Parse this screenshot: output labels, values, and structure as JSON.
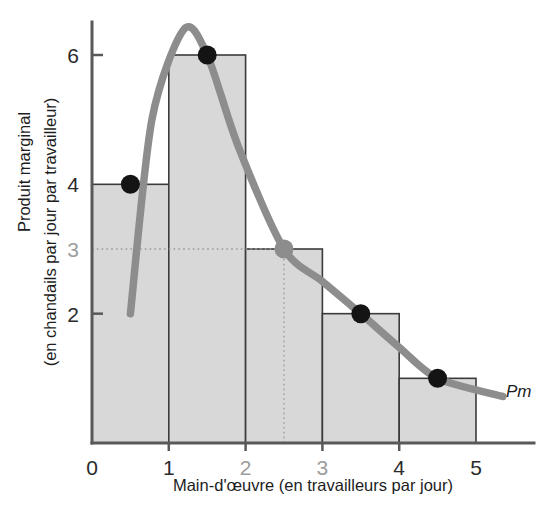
{
  "chart_data": {
    "type": "bar",
    "title": "",
    "subtitle": "",
    "xlabel": "Main-d'œuvre (en travailleurs par jour)",
    "ylabel_line1": "Produit marginal",
    "ylabel_line2": "(en chandails par jour par travailleur)",
    "xlim": [
      0,
      5.55
    ],
    "ylim": [
      0,
      6.55
    ],
    "grid": true,
    "legend_position": "inline-right",
    "categories": [
      "0-1",
      "1-2",
      "2-3",
      "3-4",
      "4-5"
    ],
    "values": [
      4,
      6,
      3,
      2,
      1
    ],
    "bar_intervals": [
      [
        0,
        1
      ],
      [
        1,
        2
      ],
      [
        2,
        3
      ],
      [
        3,
        4
      ],
      [
        4,
        5
      ]
    ],
    "x_ticks": [
      {
        "value": 0,
        "label": "0",
        "muted": false
      },
      {
        "value": 1,
        "label": "1",
        "muted": false
      },
      {
        "value": 2,
        "label": "2",
        "muted": true
      },
      {
        "value": 3,
        "label": "3",
        "muted": true
      },
      {
        "value": 4,
        "label": "4",
        "muted": false
      },
      {
        "value": 5,
        "label": "5",
        "muted": false
      }
    ],
    "y_ticks": [
      {
        "value": 2,
        "label": "2",
        "muted": false,
        "tickmark": true
      },
      {
        "value": 3,
        "label": "3",
        "muted": true,
        "tickmark": false
      },
      {
        "value": 4,
        "label": "4",
        "muted": false,
        "tickmark": false
      },
      {
        "value": 6,
        "label": "6",
        "muted": false,
        "tickmark": true
      }
    ],
    "gridlines": {
      "horizontal_dotted": [
        {
          "y": 3,
          "x_from": 0,
          "x_to": 2.5
        }
      ],
      "vertical_dotted": [
        {
          "x": 2.5,
          "y_from": 0,
          "y_to": 3
        }
      ]
    },
    "series": [
      {
        "name": "Pm",
        "type": "line",
        "label": "Pm",
        "color": "#8d8d8d",
        "points": [
          {
            "x": 0.5,
            "y": 4,
            "marker": "black"
          },
          {
            "x": 1.5,
            "y": 6,
            "marker": "black"
          },
          {
            "x": 2.5,
            "y": 3,
            "marker": "grey"
          },
          {
            "x": 3.5,
            "y": 2,
            "marker": "black"
          },
          {
            "x": 4.5,
            "y": 1,
            "marker": "black"
          }
        ],
        "curve_start": {
          "x": 0.5,
          "y": 2
        },
        "curve_peak": {
          "x": 1.2,
          "y": 6.4
        },
        "curve_end": {
          "x": 5.35,
          "y": 0.72
        }
      }
    ],
    "colors": {
      "bar_fill": "#d8d8d8",
      "bar_stroke": "#3b3b3b",
      "curve": "#8d8d8d",
      "marker_black": "#141414",
      "marker_grey": "#8d8d8d",
      "axis": "#58595b",
      "text": "#1d1d1d",
      "text_muted": "#9d9d9d",
      "background": "#ffffff"
    }
  }
}
